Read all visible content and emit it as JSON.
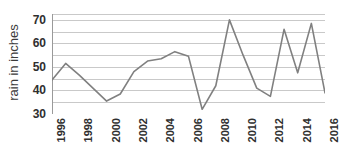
{
  "chart_data": {
    "type": "line",
    "title": "",
    "xlabel": "",
    "ylabel": "rain in inches",
    "x": [
      1996,
      1997,
      1998,
      1999,
      2000,
      2001,
      2002,
      2003,
      2004,
      2005,
      2006,
      2007,
      2008,
      2009,
      2010,
      2011,
      2012,
      2013,
      2014,
      2015,
      2016
    ],
    "values": [
      44.5,
      51.5,
      46.5,
      41,
      35.5,
      38.5,
      48,
      52.5,
      53.5,
      56.5,
      54.5,
      32,
      42,
      70,
      55,
      41,
      37.5,
      66,
      47.5,
      68.5,
      39
    ],
    "series": [
      {
        "name": "rain in inches",
        "color": "#808080",
        "values": [
          44.5,
          51.5,
          46.5,
          41,
          35.5,
          38.5,
          48,
          52.5,
          53.5,
          56.5,
          54.5,
          32,
          42,
          70,
          55,
          41,
          37.5,
          66,
          47.5,
          68.5,
          39
        ]
      }
    ],
    "ylim": [
      30,
      72.5
    ],
    "xlim": [
      1996,
      2016
    ],
    "y_ticks_labeled": [
      30,
      40,
      50,
      60,
      70
    ],
    "y_gridlines": [
      30,
      35,
      40,
      45,
      50,
      55,
      60,
      65,
      70,
      72.5
    ],
    "x_ticks_labeled": [
      1996,
      1998,
      2000,
      2002,
      2004,
      2006,
      2008,
      2010,
      2012,
      2014,
      2016
    ],
    "x_tick_labels": [
      "1996",
      "1998",
      "2000",
      "2002",
      "2004",
      "2006",
      "2008",
      "2010",
      "2012",
      "2014",
      "2016"
    ],
    "x_tick_label_rotation": -90,
    "grid": true,
    "grid_color": "#c9c9c9",
    "axis_color": "#9a9a9a",
    "legend": "none",
    "legend_position": "none"
  },
  "axis": {
    "y_title": "rain in inches",
    "y_labels": [
      "70",
      "60",
      "50",
      "40",
      "30"
    ],
    "x_labels": [
      "1996",
      "1998",
      "2000",
      "2002",
      "2004",
      "2006",
      "2008",
      "2010",
      "2012",
      "2014",
      "2016"
    ]
  },
  "colors": {
    "line": "#808080",
    "grid": "#c9c9c9",
    "axis": "#9a9a9a",
    "text": "#2f2f2f",
    "background": "#ffffff"
  }
}
